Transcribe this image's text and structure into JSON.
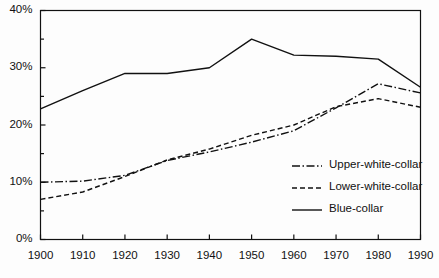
{
  "chart_data": {
    "type": "line",
    "title": "",
    "subtitle": "",
    "xlabel": "",
    "ylabel": "",
    "xlim": [
      1900,
      1990
    ],
    "ylim": [
      0,
      40
    ],
    "x": [
      1900,
      1910,
      1920,
      1930,
      1940,
      1950,
      1960,
      1970,
      1980,
      1990
    ],
    "xtick_labels": [
      "1900",
      "1910",
      "1920",
      "1930",
      "1940",
      "1950",
      "1960",
      "1970",
      "1980",
      "1990"
    ],
    "ytick_labels": [
      "0%",
      "10%",
      "20%",
      "30%",
      "40%"
    ],
    "ytick_values": [
      0,
      10,
      20,
      30,
      40
    ],
    "yminor_values": [
      5,
      15,
      25,
      35
    ],
    "grid": false,
    "legend_position": "center-right",
    "series": [
      {
        "name": "Upper-white-collar",
        "style": "dash-dot",
        "color": "#111111",
        "values": [
          10.0,
          10.2,
          11.2,
          13.8,
          15.3,
          17.0,
          19.0,
          23.0,
          27.2,
          25.6
        ]
      },
      {
        "name": "Lower-white-collar",
        "style": "dashed",
        "color": "#111111",
        "values": [
          7.0,
          8.3,
          11.0,
          13.9,
          15.8,
          18.2,
          20.0,
          23.2,
          24.6,
          23.1
        ]
      },
      {
        "name": "Blue-collar",
        "style": "solid",
        "color": "#111111",
        "values": [
          22.8,
          26.0,
          29.0,
          29.0,
          30.0,
          35.0,
          32.2,
          32.0,
          31.5,
          26.6
        ]
      }
    ]
  },
  "legend": {
    "items": [
      {
        "label": "Upper-white-collar",
        "style": "dash-dot"
      },
      {
        "label": "Lower-white-collar",
        "style": "dashed"
      },
      {
        "label": "Blue-collar",
        "style": "solid"
      }
    ]
  }
}
